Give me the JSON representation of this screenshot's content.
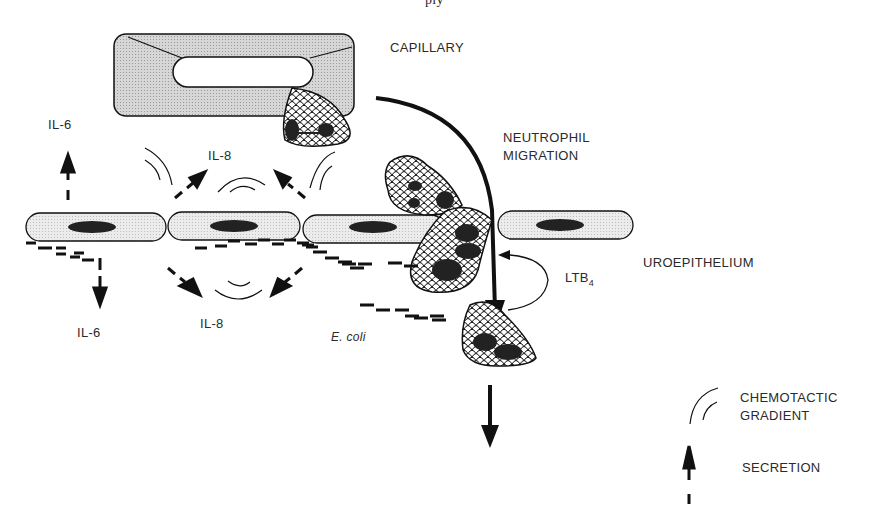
{
  "figure": {
    "cropped_title_fragment": "ply",
    "labels": {
      "capillary": "CAPILLARY",
      "neutrophil_migration_line1": "NEUTROPHIL",
      "neutrophil_migration_line2": "MIGRATION",
      "uroepithelium": "UROEPITHELIUM",
      "ltb4": "LTB",
      "ltb4_subscript": "4",
      "il6_top": "IL-6",
      "il6_bottom": "IL-6",
      "il8_top": "IL-8",
      "il8_bottom": "IL-8",
      "ecoli": "E. coli"
    },
    "legend": {
      "items": [
        {
          "icon": "chemotactic-gradient-arcs",
          "line1": "CHEMOTACTIC",
          "line2": "GRADIENT"
        },
        {
          "icon": "dashed-arrow-up",
          "line1": "SECRETION"
        }
      ]
    },
    "colors": {
      "capillary_fill": "#c8c8c8",
      "cell_fill": "#e4e4e4",
      "nucleus": "#222222",
      "stroke": "#1a1a1a"
    }
  }
}
